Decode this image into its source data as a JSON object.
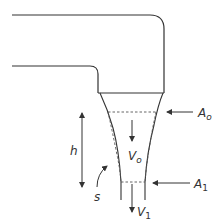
{
  "diagram": {
    "labels": {
      "area_top": "A",
      "area_top_sub": "o",
      "area_bottom": "A",
      "area_bottom_sub": "1",
      "velocity_top": "V",
      "velocity_top_sub": "o",
      "velocity_bottom": "V",
      "velocity_bottom_sub": "1",
      "height": "h",
      "streamline": "s"
    },
    "colors": {
      "stroke": "#333333",
      "dashed": "#555555",
      "background": "#ffffff"
    }
  }
}
